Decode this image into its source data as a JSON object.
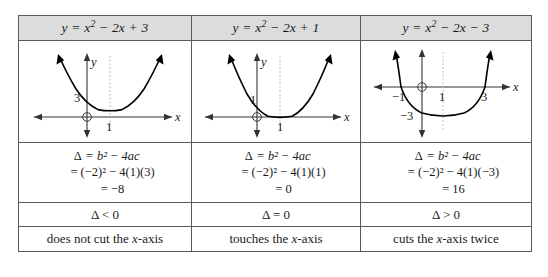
{
  "table": {
    "columns": [
      {
        "header": "y = x² − 2x + 3",
        "header_parts": {
          "lhs": "y = x",
          "exp": "2",
          "rhs": " − 2x + 3"
        },
        "graph": {
          "name": "parabola-no-roots",
          "y_intercept_label": "3",
          "vertex_x_label": "1",
          "x_axis_label": "x",
          "y_axis_label": "y",
          "roots": [],
          "vertex": [
            1,
            2
          ],
          "y_intercept": 3,
          "cuts_axis": false
        },
        "calc": {
          "line1_symbol": "Δ",
          "line1": "= b² − 4ac",
          "line2": "= (−2)² − 4(1)(3)",
          "line3": "= −8"
        },
        "sign": "Δ < 0",
        "description": "does not cut the x-axis",
        "description_parts": {
          "before": "does not cut the ",
          "var": "x",
          "after": "-axis"
        }
      },
      {
        "header": "y = x² − 2x + 1",
        "header_parts": {
          "lhs": "y = x",
          "exp": "2",
          "rhs": " − 2x + 1"
        },
        "graph": {
          "name": "parabola-one-root",
          "y_intercept_label": "1",
          "vertex_x_label": "1",
          "x_axis_label": "x",
          "y_axis_label": "y",
          "roots": [
            1
          ],
          "vertex": [
            1,
            0
          ],
          "y_intercept": 1,
          "cuts_axis": false
        },
        "calc": {
          "line1_symbol": "Δ",
          "line1": "= b² − 4ac",
          "line2": "= (−2)² − 4(1)(1)",
          "line3": "= 0"
        },
        "sign": "Δ = 0",
        "description": "touches the x-axis",
        "description_parts": {
          "before": "touches the ",
          "var": "x",
          "after": "-axis"
        }
      },
      {
        "header": "y = x² − 2x − 3",
        "header_parts": {
          "lhs": "y = x",
          "exp": "2",
          "rhs": " − 2x − 3"
        },
        "graph": {
          "name": "parabola-two-roots",
          "y_intercept_label": "−3",
          "root_left_label": "−1",
          "vertex_x_label": "1",
          "root_right_label": "3",
          "x_axis_label": "x",
          "y_axis_label": "y",
          "roots": [
            -1,
            3
          ],
          "vertex": [
            1,
            -4
          ],
          "y_intercept": -3,
          "cuts_axis": true
        },
        "calc": {
          "line1_symbol": "Δ",
          "line1": "= b² − 4ac",
          "line2": "= (−2)² − 4(1)(−3)",
          "line3": "= 16"
        },
        "sign": "Δ > 0",
        "description": "cuts the x-axis twice",
        "description_parts": {
          "before": "cuts the ",
          "var": "x",
          "after": "-axis twice"
        }
      }
    ]
  },
  "colors": {
    "header_background": "#dcdcdc",
    "border": "#5a5a5a",
    "text": "#1a1a1a",
    "curve": "#000000",
    "dotted_axis": "#9a9a9a"
  }
}
